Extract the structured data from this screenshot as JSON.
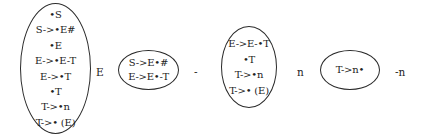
{
  "diagram": {
    "type": "LR(0) item-set state sequence",
    "states": [
      {
        "id": "state-0",
        "items": [
          "•S",
          "S->•E#",
          "•E",
          "E->•E-T",
          "E->•T",
          "•T",
          "T->•n",
          "T->• (E)"
        ]
      },
      {
        "id": "state-1",
        "items": [
          "S->E•#",
          "E->E•-T"
        ]
      },
      {
        "id": "state-2",
        "items": [
          "E->E-•T",
          "•T",
          "T->•n",
          "T->• (E)"
        ]
      },
      {
        "id": "state-3",
        "items": [
          "T->n•"
        ]
      }
    ],
    "transitions": [
      {
        "from": "state-0",
        "to": "state-1",
        "symbol": "E"
      },
      {
        "from": "state-1",
        "to": "state-2",
        "symbol": "-"
      },
      {
        "from": "state-2",
        "to": "state-3",
        "symbol": "n"
      },
      {
        "from": "state-3",
        "to": null,
        "symbol": "-n"
      }
    ]
  }
}
